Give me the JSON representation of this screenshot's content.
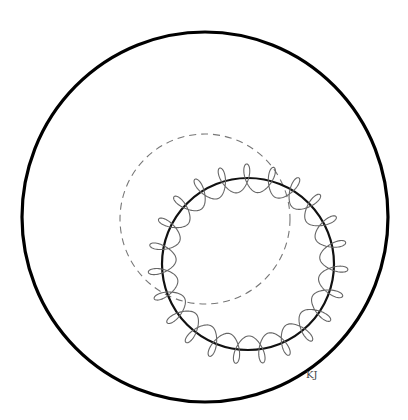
{
  "diagram": {
    "canvas": {
      "width": 408,
      "height": 420,
      "background": "#ffffff"
    },
    "outer_circle": {
      "cx": 205,
      "cy": 217,
      "rx": 183,
      "ry": 185,
      "stroke": "#000000",
      "stroke_width": 3.2
    },
    "dashed_circle": {
      "cx": 205,
      "cy": 219,
      "r": 85,
      "stroke": "#777777",
      "stroke_width": 1.1,
      "dash": "7,5"
    },
    "bold_circle": {
      "cx": 248,
      "cy": 264,
      "r": 86,
      "stroke": "#111111",
      "stroke_width": 2.2
    },
    "wave": {
      "cx": 248,
      "cy": 264,
      "r": 86,
      "amplitude": 14,
      "periods": 23,
      "phase": 0.3,
      "stroke": "#666666",
      "stroke_width": 1.1
    },
    "signature": {
      "text": "KJ",
      "x": 306,
      "y": 369
    }
  }
}
